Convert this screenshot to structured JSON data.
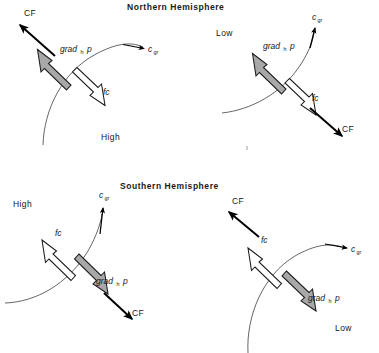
{
  "figure": {
    "kind": "force-balance-diagram",
    "background": "#ffffff",
    "titles": {
      "northern": "Northern Hemisphere",
      "southern": "Southern Hemisphere"
    },
    "legend_semantics": {
      "grad_arrow": "gray-filled thick arrow = horizontal pressure gradient force",
      "fc_arrow": "white hollow thick arrow = Coriolis force",
      "cf_arrow": "thin solid black arrow = centrifugal force",
      "curve": "thin arc = isobar / trajectory"
    },
    "colors": {
      "grad_fill": "#a8a8a8",
      "grad_stroke": "#1a1a1a",
      "fc_fill": "#ffffff",
      "fc_stroke": "#1a1a1a",
      "cf_fill": "#000000",
      "arc_stroke": "#4a4a4a",
      "text": "#151515"
    }
  },
  "panels": [
    {
      "id": "nh-high",
      "hemisphere": "Northern Hemisphere",
      "pressure_center": "High",
      "labels": {
        "cf": "CF",
        "grad": "grad",
        "grad_sub": "h",
        "grad_var": "p",
        "c": "c",
        "c_sub": "gr",
        "fc": "fc",
        "center": "High"
      }
    },
    {
      "id": "nh-low",
      "hemisphere": "Northern Hemisphere",
      "pressure_center": "Low",
      "labels": {
        "cf": "CF",
        "grad": "grad",
        "grad_sub": "h",
        "grad_var": "p",
        "c": "c",
        "c_sub": "gr",
        "fc": "fc",
        "center": "Low"
      }
    },
    {
      "id": "sh-high",
      "hemisphere": "Southern Hemisphere",
      "pressure_center": "High",
      "labels": {
        "cf": "CF",
        "grad": "grad",
        "grad_sub": "h",
        "grad_var": "p",
        "c": "c",
        "c_sub": "gr",
        "fc": "fc",
        "center": "High"
      }
    },
    {
      "id": "sh-low",
      "hemisphere": "Southern Hemisphere",
      "pressure_center": "Low",
      "labels": {
        "cf": "CF",
        "grad": "grad",
        "grad_sub": "h",
        "grad_var": "p",
        "c": "c",
        "c_sub": "gr",
        "fc": "fc",
        "center": "Low"
      }
    }
  ]
}
